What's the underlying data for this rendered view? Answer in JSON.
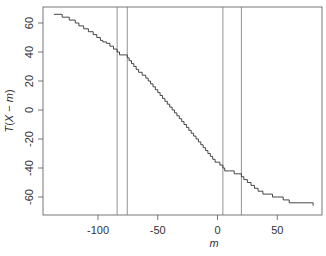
{
  "chart_data": {
    "type": "line",
    "subtype": "step",
    "title": "",
    "xlabel": "m",
    "ylabel": "T(X − m)",
    "xlim": [
      -145,
      88
    ],
    "ylim": [
      -72,
      71
    ],
    "xticks": [
      -100,
      -50,
      0,
      50
    ],
    "yticks": [
      -60,
      -40,
      -20,
      0,
      20,
      40,
      60
    ],
    "grid": false,
    "vertical_lines": [
      -84,
      -75.5,
      4.5,
      20
    ],
    "series": [
      {
        "name": "T(X-m)",
        "x": [
          -137,
          -130,
          -124,
          -119,
          -116,
          -112,
          -108,
          -104,
          -101,
          -98,
          -96,
          -93,
          -90,
          -87,
          -84,
          -82,
          -80,
          -75.5,
          -74,
          -72,
          -70,
          -68,
          -66,
          -63,
          -60,
          -58,
          -56,
          -54,
          -52,
          -50,
          -48,
          -46,
          -44,
          -42,
          -40,
          -38,
          -36,
          -34,
          -32,
          -30,
          -28,
          -26,
          -24,
          -22,
          -20,
          -18,
          -16,
          -14,
          -12,
          -10,
          -8,
          -6,
          -4,
          -2,
          0,
          2,
          4.5,
          6,
          10,
          14,
          18,
          20,
          22,
          25,
          28,
          31,
          34,
          38,
          42,
          46,
          50,
          55,
          60,
          70,
          80
        ],
        "y": [
          66,
          64,
          62,
          60,
          58,
          56,
          54,
          52,
          50,
          48,
          47,
          46,
          44,
          42,
          40,
          38,
          38,
          36,
          34,
          32,
          30,
          28,
          26,
          24,
          22,
          20,
          18,
          16,
          14,
          12,
          10,
          8,
          6,
          4,
          2,
          0,
          -2,
          -4,
          -6,
          -8,
          -10,
          -12,
          -14,
          -16,
          -18,
          -20,
          -22,
          -24,
          -26,
          -28,
          -30,
          -32,
          -34,
          -36,
          -36,
          -38,
          -40,
          -42,
          -42,
          -44,
          -44,
          -46,
          -48,
          -50,
          -52,
          -54,
          -56,
          -58,
          -58,
          -60,
          -60,
          -62,
          -64,
          -64,
          -66
        ]
      }
    ]
  }
}
